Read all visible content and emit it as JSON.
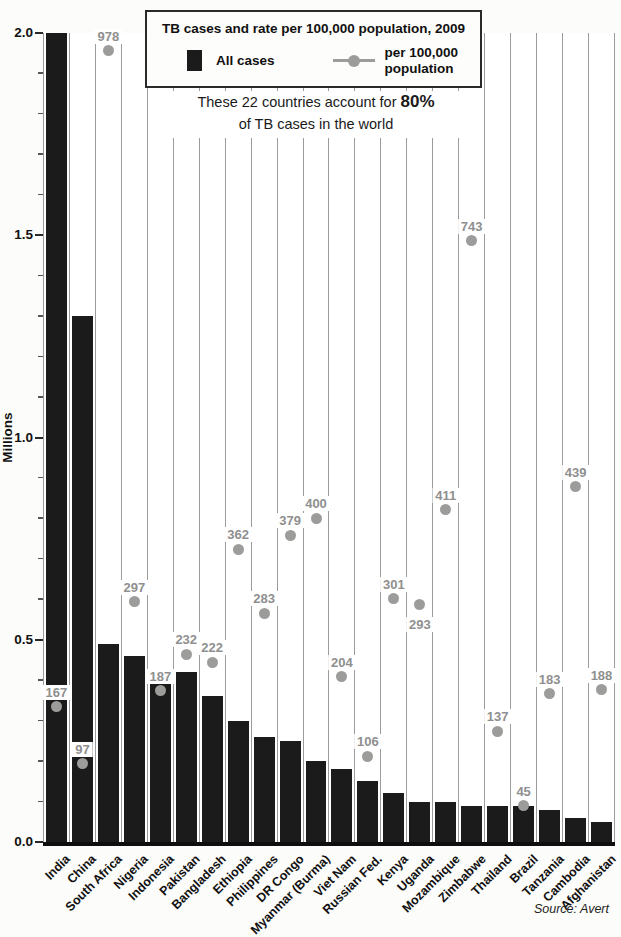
{
  "legend": {
    "title": "TB cases and rate per 100,000 population, 2009",
    "items": [
      {
        "label": "All cases",
        "marker": "black-bar-swatch"
      },
      {
        "label": "per 100,000 population",
        "marker": "gray-line-dot"
      }
    ]
  },
  "subtitle": {
    "text_before": "These 22 countries account for ",
    "highlight": "80%",
    "line2": "of TB cases in the world"
  },
  "y_axis": {
    "title": "Millions",
    "tick_labels": [
      "0.0",
      "0.5",
      "1.0",
      "1.5",
      "2.0"
    ],
    "minor_tick_interval": 0.1,
    "max": 2.0
  },
  "source_note": "Source: Avert",
  "colors": {
    "bar": "#1b1b1b",
    "dot": "#9c9c9a",
    "rate_label": "#8f8f8f",
    "column_border": "#9b9b9b",
    "legend_border": "#2a2a2a",
    "background": "#fcfcfa"
  },
  "chart_data": {
    "type": "bar",
    "title": "TB cases and rate per 100,000 population, 2009",
    "annotation": "These 22 countries account for 80% of TB cases in the world",
    "categories": [
      "India",
      "China",
      "South Africa",
      "Nigeria",
      "Indonesia",
      "Pakistan",
      "Bangladesh",
      "Ethiopia",
      "Philippines",
      "DR Congo",
      "Myanmar (Burma)",
      "Viet Nam",
      "Russian Fed.",
      "Kenya",
      "Uganda",
      "Mozambique",
      "Zimbabwe",
      "Thailand",
      "Brazil",
      "Tanzania",
      "Cambodia",
      "Afghanistan"
    ],
    "series": [
      {
        "name": "All cases",
        "type": "bar",
        "unit": "millions",
        "values": [
          2.0,
          1.3,
          0.49,
          0.46,
          0.4,
          0.42,
          0.36,
          0.3,
          0.26,
          0.25,
          0.2,
          0.18,
          0.15,
          0.12,
          0.1,
          0.1,
          0.09,
          0.09,
          0.09,
          0.08,
          0.06,
          0.05
        ]
      },
      {
        "name": "per 100,000 population",
        "type": "point",
        "unit": "rate per 100,000",
        "values": [
          167,
          97,
          978,
          297,
          187,
          232,
          222,
          362,
          283,
          379,
          400,
          204,
          106,
          301,
          293,
          411,
          743,
          137,
          45,
          183,
          439,
          188
        ]
      }
    ],
    "xlabel": "",
    "ylabel": "Millions",
    "ylim": [
      0,
      2.0
    ],
    "rate_axis_mapping": "rate of 500 per 100,000 aligns with 1.0 million on shared axis (rate axis 0-1000)",
    "rate_label_position_overrides": {
      "Uganda": "below"
    },
    "grid": "full-height white columns with thin gray outlines",
    "legend_position": "top-center boxed"
  }
}
